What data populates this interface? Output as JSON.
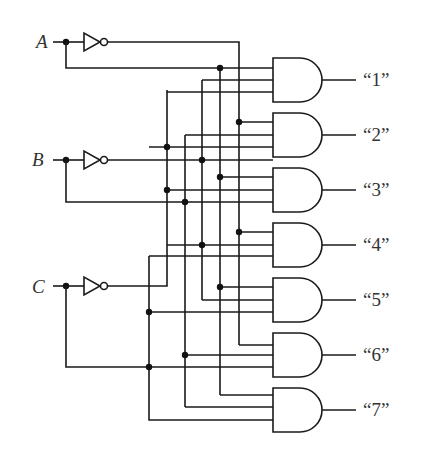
{
  "diagram": {
    "inputs": [
      {
        "label": "A",
        "y": 42
      },
      {
        "label": "B",
        "y": 160
      },
      {
        "label": "C",
        "y": 286
      }
    ],
    "outputs": [
      {
        "label": "“1”"
      },
      {
        "label": "“2”"
      },
      {
        "label": "“3”"
      },
      {
        "label": "“4”"
      },
      {
        "label": "“5”"
      },
      {
        "label": "“6”"
      },
      {
        "label": "“7”"
      }
    ],
    "components": {
      "inverters": 3,
      "and_gates": 7,
      "and_gate_inputs": 3
    },
    "colors": {
      "line": "#1a1a1a",
      "text": "#333333",
      "background": "#ffffff"
    }
  }
}
